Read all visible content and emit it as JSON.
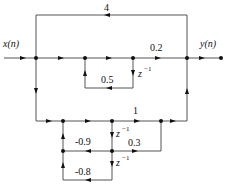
{
  "diagram": {
    "type": "signal-flow-graph",
    "input_label": "x(n)",
    "output_label": "y(n)",
    "gains": {
      "top_feedforward": "4",
      "main_path": "0.2",
      "first_loop": "0.5",
      "lower_path": "1",
      "lower_loop_1": "-0.9",
      "lower_branch": "0.3",
      "lower_loop_2": "-0.8"
    },
    "delay_label_base": "z",
    "delay_label_exp": "−1"
  }
}
